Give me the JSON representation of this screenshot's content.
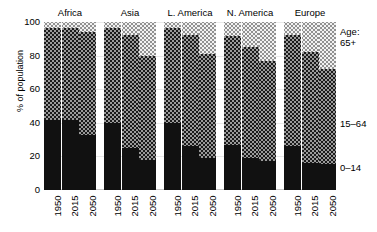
{
  "chart_data": {
    "type": "bar",
    "subtype": "stacked-percentage-small-multiples",
    "title": "",
    "xlabel": "",
    "ylabel": "% of population",
    "ylim": [
      0,
      100
    ],
    "y_ticks": [
      0,
      20,
      40,
      60,
      80,
      100
    ],
    "grid": true,
    "legend_position": "right",
    "stack_order_bottom_to_top": [
      "0–14",
      "15–64",
      "65+"
    ],
    "categories": [
      "1950",
      "2015",
      "2050"
    ],
    "panels": [
      {
        "name": "Africa",
        "bars": [
          {
            "year": "1950",
            "young_0_14": 41.5,
            "working_15_64": 55.0,
            "old_65plus": 3.5
          },
          {
            "year": "2015",
            "young_0_14": 41.5,
            "working_15_64": 55.0,
            "old_65plus": 3.5
          },
          {
            "year": "2050",
            "young_0_14": 32.5,
            "working_15_64": 61.5,
            "old_65plus": 6.0
          }
        ]
      },
      {
        "name": "Asia",
        "bars": [
          {
            "year": "1950",
            "young_0_14": 40.0,
            "working_15_64": 56.5,
            "old_65plus": 3.5
          },
          {
            "year": "2015",
            "young_0_14": 25.0,
            "working_15_64": 67.5,
            "old_65plus": 7.5
          },
          {
            "year": "2050",
            "young_0_14": 18.0,
            "working_15_64": 62.0,
            "old_65plus": 20.0
          }
        ]
      },
      {
        "name": "L. America",
        "bars": [
          {
            "year": "1950",
            "young_0_14": 40.0,
            "working_15_64": 56.5,
            "old_65plus": 3.5
          },
          {
            "year": "2015",
            "young_0_14": 26.0,
            "working_15_64": 66.0,
            "old_65plus": 8.0
          },
          {
            "year": "2050",
            "young_0_14": 19.0,
            "working_15_64": 62.0,
            "old_65plus": 19.0
          }
        ]
      },
      {
        "name": "N. America",
        "bars": [
          {
            "year": "1950",
            "young_0_14": 27.0,
            "working_15_64": 64.5,
            "old_65plus": 8.5
          },
          {
            "year": "2015",
            "young_0_14": 19.0,
            "working_15_64": 66.0,
            "old_65plus": 15.0
          },
          {
            "year": "2050",
            "young_0_14": 17.5,
            "working_15_64": 59.5,
            "old_65plus": 23.0
          }
        ]
      },
      {
        "name": "Europe",
        "bars": [
          {
            "year": "1950",
            "young_0_14": 26.0,
            "working_15_64": 66.0,
            "old_65plus": 8.0
          },
          {
            "year": "2015",
            "young_0_14": 16.0,
            "working_15_64": 66.0,
            "old_65plus": 18.0
          },
          {
            "year": "2050",
            "young_0_14": 15.5,
            "working_15_64": 56.5,
            "old_65plus": 28.0
          }
        ]
      }
    ],
    "legend": [
      {
        "prefix": "Age:",
        "label": "65+",
        "key": "old_65plus"
      },
      {
        "prefix": "",
        "label": "15–64",
        "key": "working_15_64"
      },
      {
        "prefix": "",
        "label": "0–14",
        "key": "young_0_14"
      }
    ],
    "colors": {
      "young_0_14": "#111111",
      "working_15_64": "#9a9a9a",
      "old_65plus": "#f2f2f2",
      "grid": "#e9e9e9",
      "axis": "#000000",
      "background": "#ffffff"
    }
  }
}
